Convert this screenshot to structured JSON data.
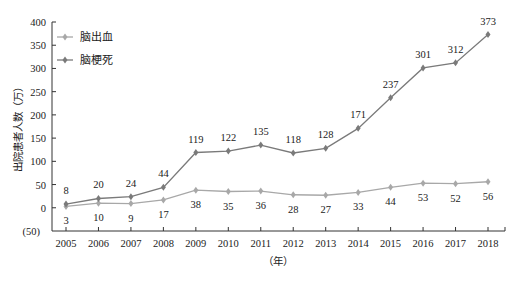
{
  "chart_data": {
    "type": "line",
    "title": "",
    "xlabel": "（年）",
    "ylabel": "出院患者人数（万）",
    "ylim": [
      -50,
      400
    ],
    "yticks": [
      400,
      350,
      300,
      250,
      200,
      150,
      100,
      50,
      0,
      -50
    ],
    "ytick_labels": [
      "400",
      "350",
      "300",
      "250",
      "200",
      "150",
      "100",
      "50",
      "0",
      "(50)"
    ],
    "categories": [
      "2005",
      "2006",
      "2007",
      "2008",
      "2009",
      "2010",
      "2011",
      "2012",
      "2013",
      "2014",
      "2015",
      "2016",
      "2017",
      "2018"
    ],
    "series": [
      {
        "name": "脑出血",
        "color": "#a8a8a8",
        "label_position": "below",
        "values": [
          3,
          10,
          9,
          17,
          38,
          35,
          36,
          28,
          27,
          33,
          44,
          53,
          52,
          56
        ]
      },
      {
        "name": "脑梗死",
        "color": "#7a7a7a",
        "label_position": "above",
        "values": [
          8,
          20,
          24,
          44,
          119,
          122,
          135,
          118,
          128,
          171,
          237,
          301,
          312,
          373
        ]
      }
    ],
    "grid": false,
    "legend_position": "top-left"
  }
}
